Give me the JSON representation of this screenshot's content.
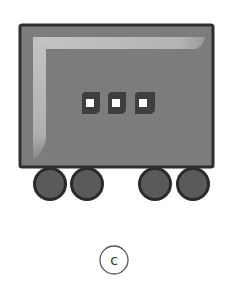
{
  "figure": {
    "label": "c",
    "colors": {
      "body_fill": "#7c7c7c",
      "body_border": "#2e2e2e",
      "highlight": "#b8b8b8",
      "indicator_fill": "#3e3e3e",
      "indicator_light": "#ffffff",
      "wheel_fill": "#5a5a5a",
      "wheel_border": "#2a2a2a",
      "label_circle": "#555555"
    },
    "indicators": [
      {
        "name": "light-1"
      },
      {
        "name": "light-2"
      },
      {
        "name": "light-3"
      }
    ],
    "wheels": [
      {
        "name": "wheel-1"
      },
      {
        "name": "wheel-2"
      },
      {
        "name": "wheel-3"
      },
      {
        "name": "wheel-4"
      }
    ]
  }
}
